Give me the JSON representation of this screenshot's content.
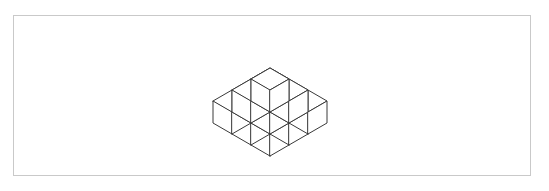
{
  "page": {
    "width": 549,
    "height": 191,
    "background_color": "#ffffff"
  },
  "frame": {
    "name": "figure-border",
    "x": 13,
    "y": 15,
    "width": 518,
    "height": 161,
    "border_color": "#c9c9c9",
    "border_width": 1,
    "fill_color": "#ffffff"
  },
  "figure": {
    "name": "isometric-cube-stack",
    "line_color": "#3a3a3a",
    "line_width": 1,
    "face_fill": "#ffffff",
    "projection": "isometric",
    "cube_half_width": 19,
    "cube_half_depth": 11,
    "cube_height": 22,
    "origin": {
      "x": 270,
      "y": 156,
      "note": "bottom-front vertex of the base of the stack"
    },
    "bounds": {
      "left": 218,
      "right": 331,
      "top": 30,
      "bottom": 157
    },
    "layers": [
      {
        "level": 0,
        "label": "bottom layer",
        "footprint": "3x3",
        "cube_count": 9,
        "cells": [
          [
            0,
            0
          ],
          [
            1,
            0
          ],
          [
            2,
            0
          ],
          [
            0,
            1
          ],
          [
            1,
            1
          ],
          [
            2,
            1
          ],
          [
            0,
            2
          ],
          [
            1,
            2
          ],
          [
            2,
            2
          ]
        ]
      },
      {
        "level": 1,
        "label": "middle layer",
        "footprint": "2x2",
        "cube_count": 4,
        "cells": [
          [
            0,
            0
          ],
          [
            1,
            0
          ],
          [
            0,
            1
          ],
          [
            1,
            1
          ]
        ]
      },
      {
        "level": 2,
        "label": "top layer",
        "footprint": "1x1",
        "cube_count": 1,
        "cells": [
          [
            0,
            0
          ]
        ]
      }
    ],
    "total_cube_count": 14,
    "visible_cube_count": 14
  }
}
